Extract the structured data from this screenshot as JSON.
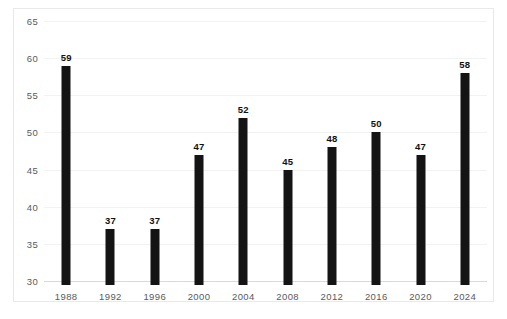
{
  "chart_data": {
    "type": "bar",
    "title": "",
    "subtitle": "",
    "xlabel": "",
    "ylabel": "",
    "categories": [
      "1988",
      "1992",
      "1996",
      "2000",
      "2004",
      "2008",
      "2012",
      "2016",
      "2020",
      "2024"
    ],
    "values": [
      59,
      37,
      37,
      47,
      52,
      45,
      48,
      50,
      47,
      58
    ],
    "data_labels": [
      "59",
      "37",
      "37",
      "47",
      "52",
      "45",
      "48",
      "50",
      "47",
      "58"
    ],
    "ylim": [
      30,
      65
    ],
    "ytick_step": 5,
    "ytick_labels": [
      "65",
      "60",
      "55",
      "50",
      "45",
      "40",
      "35",
      "30"
    ],
    "ytick_values": [
      65,
      60,
      55,
      50,
      45,
      40,
      35,
      30
    ],
    "grid": true,
    "grid_axis": "y",
    "legend": false,
    "legend_position": "none",
    "bar_color": "#141414",
    "gridline_color": "#f2f2f3",
    "axis_color": "#d9d9da",
    "tick_label_color": "#5a5a5c",
    "data_label_color": "#111111",
    "plot_background": "#ffffff",
    "frame_border_color": "#e9e9ea"
  }
}
